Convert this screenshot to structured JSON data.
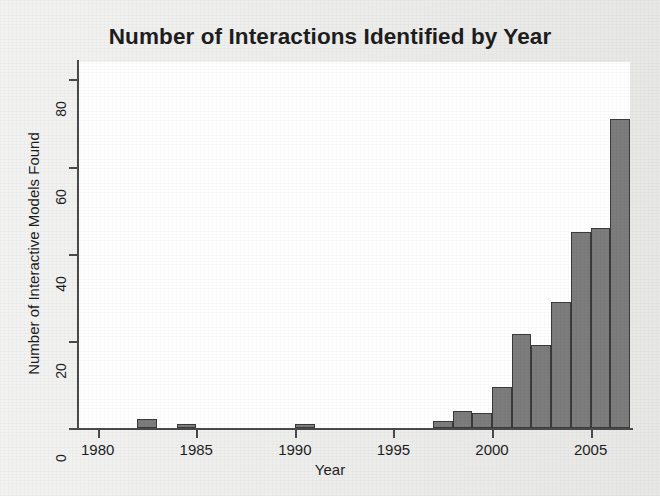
{
  "chart_data": {
    "type": "bar",
    "title": "Number of Interactions Identified by Year",
    "xlabel": "Year",
    "ylabel": "Number of Interactive Models Found",
    "grid": false,
    "legend": false,
    "xlim": [
      1979,
      2007
    ],
    "ylim": [
      0,
      84
    ],
    "xticks": [
      "1980",
      "1985",
      "1990",
      "1995",
      "2000",
      "2005"
    ],
    "xtick_values": [
      1980,
      1985,
      1990,
      1995,
      2000,
      2005
    ],
    "yticks": [
      "0",
      "20",
      "40",
      "60",
      "80"
    ],
    "ytick_values": [
      0,
      20,
      40,
      60,
      80
    ],
    "bar_color": "#7c7c7c",
    "bar_edge_color": "#3a3a3a",
    "plot_background": "#ffffff",
    "figure_background": "#ececeb",
    "categories": [
      1982,
      1984,
      1990,
      1997,
      1998,
      1999,
      2000,
      2001,
      2002,
      2003,
      2004,
      2005,
      2006
    ],
    "values": [
      2,
      1,
      1,
      1.5,
      4,
      3.5,
      9.5,
      21.5,
      19,
      29,
      45,
      46,
      71
    ]
  }
}
